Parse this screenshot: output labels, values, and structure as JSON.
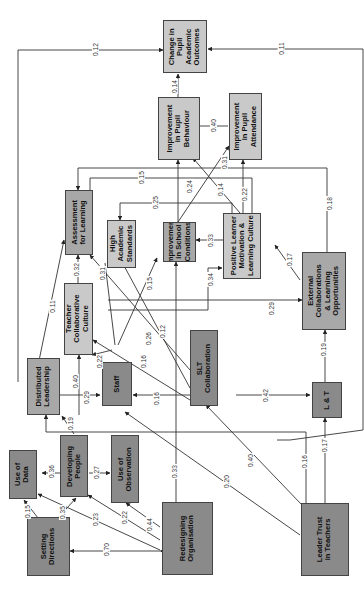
{
  "nodes": {
    "change_pupil_outcomes": "Change in\nPupil\nAcademic\nOutcomes",
    "improve_behaviour": "Improvement\nin Pupil\nBehaviour",
    "improve_attendance": "Improvement\nin Pupil\nAttendance",
    "assessment": "Assessment\nfor Learning",
    "high_standards": "High\nAcademic\nStandards",
    "improve_school": "Improvement\nin School\nConditions",
    "positive_learner": "Positive Learner\nMotivation &\nLearning Culture",
    "external_collab": "External\nCollaborations\n& Learning\nOpportunities",
    "teacher_collab": "Teacher\nCollaborative\nCulture",
    "distributed_leadership": "Distributed\nLeadership",
    "staff": "Staff",
    "slt": "SLT\nCollaboration",
    "lt": "L & T",
    "use_data": "Use of\nData",
    "developing_people": "Developing\nPeople",
    "use_observation": "Use of\nObservation",
    "setting_directions": "Setting\nDirections",
    "redesigning_org": "Redesigning\nOrganisation",
    "leader_trust": "Leader Trust\nin Teachers"
  },
  "edges": [
    {
      "from": "distributed_leadership",
      "to": "change_pupil_outcomes",
      "value": "0.12"
    },
    {
      "from": "lt",
      "to": "change_pupil_outcomes",
      "value": "0.11"
    },
    {
      "from": "improve_behaviour",
      "to": "change_pupil_outcomes",
      "value": "0.14"
    },
    {
      "from": "improve_attendance",
      "to": "improve_behaviour",
      "value": "0.40"
    },
    {
      "from": "improve_school",
      "to": "improve_attendance",
      "value": "0.31"
    },
    {
      "from": "positive_learner",
      "to": "improve_behaviour",
      "value": "0.14"
    },
    {
      "from": "improve_school",
      "to": "improve_behaviour",
      "value": "0.24"
    },
    {
      "from": "positive_learner",
      "to": "improve_attendance",
      "value": "0.22"
    },
    {
      "from": "external_collab",
      "to": "positive_learner",
      "value": "0.18"
    },
    {
      "from": "positive_learner",
      "to": "assessment",
      "value": "0.15"
    },
    {
      "from": "positive_learner",
      "to": "high_standards",
      "value": "0.25"
    },
    {
      "from": "positive_learner",
      "to": "improve_school",
      "value": "0.33"
    },
    {
      "from": "teacher_collab",
      "to": "positive_learner",
      "value": "0.34"
    },
    {
      "from": "external_collab",
      "to": "positive_learner",
      "value": "0.17"
    },
    {
      "from": "teacher_collab",
      "to": "external_collab",
      "value": "0.29"
    },
    {
      "from": "teacher_collab",
      "to": "assessment",
      "value": "0.32"
    },
    {
      "from": "staff",
      "to": "high_standards",
      "value": "0.31"
    },
    {
      "from": "staff",
      "to": "improve_school",
      "value": "0.15"
    },
    {
      "from": "distributed_leadership",
      "to": "assessment",
      "value": "0.11"
    },
    {
      "from": "slt",
      "to": "high_standards",
      "value": "0.26"
    },
    {
      "from": "slt",
      "to": "assessment",
      "value": "0.12"
    },
    {
      "from": "slt",
      "to": "teacher_collab",
      "value": "0.16"
    },
    {
      "from": "staff",
      "to": "teacher_collab",
      "value": "0.22"
    },
    {
      "from": "distributed_leadership",
      "to": "teacher_collab",
      "value": "0.40"
    },
    {
      "from": "distributed_leadership",
      "to": "staff",
      "value": "0.29"
    },
    {
      "from": "slt",
      "to": "staff",
      "value": "0.16"
    },
    {
      "from": "slt",
      "to": "lt",
      "value": "0.42"
    },
    {
      "from": "lt",
      "to": "external_collab",
      "value": "0.19"
    },
    {
      "from": "leader_trust",
      "to": "lt",
      "value": "0.17"
    },
    {
      "from": "leader_trust",
      "to": "distributed_leadership",
      "value": "0.16"
    },
    {
      "from": "leader_trust",
      "to": "slt",
      "value": "0.40"
    },
    {
      "from": "leader_trust",
      "to": "staff",
      "value": "0.20"
    },
    {
      "from": "redesigning_org",
      "to": "improve_school",
      "value": "0.33"
    },
    {
      "from": "developing_people",
      "to": "distributed_leadership",
      "value": "0.19"
    },
    {
      "from": "developing_people",
      "to": "use_data",
      "value": "0.36"
    },
    {
      "from": "developing_people",
      "to": "use_observation",
      "value": "0.27"
    },
    {
      "from": "setting_directions",
      "to": "use_data",
      "value": "0.15"
    },
    {
      "from": "setting_directions",
      "to": "developing_people",
      "value": "0.35"
    },
    {
      "from": "redesigning_org",
      "to": "use_data",
      "value": "0.23"
    },
    {
      "from": "redesigning_org",
      "to": "developing_people",
      "value": "0.22"
    },
    {
      "from": "redesigning_org",
      "to": "use_observation",
      "value": "0.44"
    },
    {
      "from": "redesigning_org",
      "to": "setting_directions",
      "value": "0.70"
    }
  ],
  "colors": {
    "light": "#c9c9c9",
    "mid": "#a8a8a8",
    "dark": "#8a8a8a",
    "line": "#333333"
  }
}
